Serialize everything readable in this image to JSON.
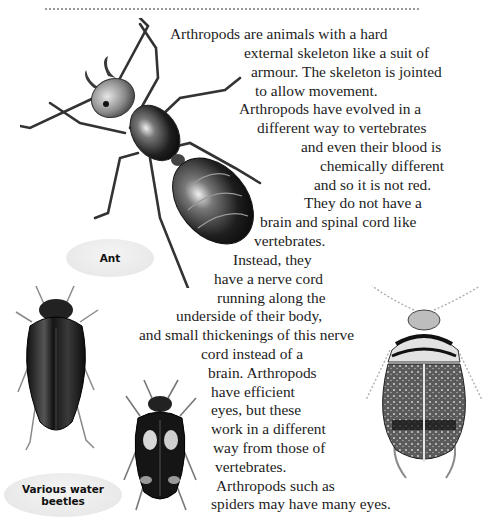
{
  "page": {
    "paragraph_lines": [
      "Arthropods are animals with a hard",
      "external skeleton like a suit of",
      "armour. The skeleton is jointed",
      "to allow movement.",
      "Arthropods have evolved in a",
      "different way to vertebrates",
      "and even their blood is",
      "chemically different",
      "and so it is not red.",
      "They do not have a",
      "brain and spinal cord like",
      "vertebrates.",
      "Instead, they",
      "have a nerve cord",
      "running along the",
      "underside of their body,",
      "and small thickenings of this nerve",
      "cord instead of a",
      "brain. Arthropods",
      "have efficient",
      "eyes, but these",
      "work in a different",
      "way from those of",
      "vertebrates.",
      "Arthropods such as",
      "spiders may have many eyes."
    ]
  },
  "captions": {
    "ant": "Ant",
    "water_beetles_line1": "Various water",
    "water_beetles_line2": "beetles"
  },
  "illustrations": {
    "ant": "ant-illustration",
    "beetle_left": "black-water-beetle-illustration",
    "beetle_middle": "spotted-water-beetle-illustration",
    "beetle_right": "striped-water-beetle-illustration"
  }
}
